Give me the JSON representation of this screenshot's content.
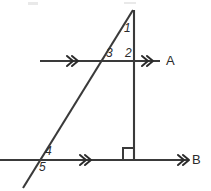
{
  "figure": {
    "type": "geometry-diagram",
    "width": 211,
    "height": 191,
    "background_color": "#ffffff",
    "stroke_color": "#3a3a3a",
    "label_color": "#2b2b2b"
  },
  "lines": {
    "line_a": {
      "label": "A",
      "label_x": 166,
      "label_y": 54,
      "y": 61,
      "x_start": 40,
      "x_end": 160,
      "tick_marks": 2,
      "tick_positions": [
        72,
        147
      ]
    },
    "line_b": {
      "label": "B",
      "label_x": 192,
      "label_y": 153,
      "y": 160,
      "x_start": 0,
      "x_end": 188,
      "tick_marks": 2,
      "tick_positions": [
        85,
        183
      ]
    },
    "transversal": {
      "name": "transversal",
      "x1": 133,
      "y1": 10,
      "x2": 23,
      "y2": 188
    },
    "perpendicular": {
      "name": "perpendicular",
      "x1": 134,
      "y1": 10,
      "x2": 134,
      "y2": 160
    }
  },
  "right_angle": {
    "name": "right-angle-marker",
    "x": 123,
    "y": 148,
    "size": 11
  },
  "angle_labels": [
    {
      "text": "1",
      "x": 124,
      "y": 22,
      "description": "apex angle between transversal and perpendicular"
    },
    {
      "text": "3",
      "x": 106,
      "y": 47,
      "description": "angle above line A left of transversal"
    },
    {
      "text": "2",
      "x": 125,
      "y": 47,
      "description": "angle above line A right of transversal"
    },
    {
      "text": "4",
      "x": 45,
      "y": 145,
      "description": "angle above line B right of transversal"
    },
    {
      "text": "5",
      "x": 39,
      "y": 161,
      "description": "angle below line B right of transversal"
    }
  ],
  "arrow_glyph": "»"
}
